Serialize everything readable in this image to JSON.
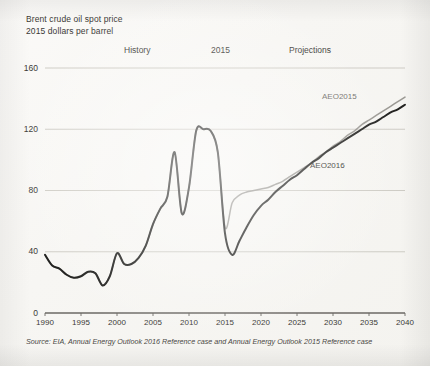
{
  "title": {
    "line1": "Brent crude oil spot price",
    "line2": "2015 dollars per barrel"
  },
  "annotations": {
    "history": "History",
    "divider_year": "2015",
    "projections": "Projections"
  },
  "series_labels": {
    "aeo2015": "AEO2015",
    "aeo2016": "AEO2016"
  },
  "source": "Source: EIA, Annual Energy Outlook 2016 Reference case and Annual Energy Outlook 2015 Reference case",
  "colors": {
    "aeo2016": "#1a1a18",
    "aeo2015": "#8e8c86",
    "grid": "#c9c7c0",
    "axis": "#6b6964",
    "text": "#3b3a36"
  },
  "chart_data": {
    "type": "line",
    "title": "Brent crude oil spot price",
    "subtitle": "2015 dollars per barrel",
    "xlabel": "",
    "ylabel": "2015 dollars per barrel",
    "xlim": [
      1990,
      2040
    ],
    "ylim": [
      0,
      160
    ],
    "yticks": [
      0,
      40,
      80,
      120,
      160
    ],
    "xticks": [
      1990,
      1995,
      2000,
      2005,
      2010,
      2015,
      2020,
      2025,
      2030,
      2035,
      2040
    ],
    "grid": true,
    "legend": "inline-labels",
    "history_end_year": 2015,
    "series": [
      {
        "name": "AEO2016",
        "color": "#1a1a18",
        "x": [
          1990,
          1991,
          1992,
          1993,
          1994,
          1995,
          1996,
          1997,
          1998,
          1999,
          2000,
          2001,
          2002,
          2003,
          2004,
          2005,
          2006,
          2007,
          2008,
          2009,
          2010,
          2011,
          2012,
          2013,
          2014,
          2015,
          2016,
          2017,
          2018,
          2019,
          2020,
          2021,
          2022,
          2023,
          2024,
          2025,
          2026,
          2027,
          2028,
          2029,
          2030,
          2031,
          2032,
          2033,
          2034,
          2035,
          2036,
          2037,
          2038,
          2039,
          2040
        ],
        "values": [
          38,
          31,
          29,
          25,
          23,
          24,
          27,
          26,
          18,
          24,
          39,
          32,
          32,
          36,
          44,
          58,
          68,
          76,
          105,
          65,
          82,
          119,
          120,
          119,
          105,
          52,
          38,
          47,
          56,
          64,
          70,
          74,
          79,
          83,
          87,
          90,
          94,
          98,
          101,
          105,
          108,
          111,
          114,
          117,
          120,
          123,
          125,
          128,
          131,
          133,
          136
        ]
      },
      {
        "name": "AEO2015",
        "color": "#8e8c86",
        "x": [
          1990,
          1991,
          1992,
          1993,
          1994,
          1995,
          1996,
          1997,
          1998,
          1999,
          2000,
          2001,
          2002,
          2003,
          2004,
          2005,
          2006,
          2007,
          2008,
          2009,
          2010,
          2011,
          2012,
          2013,
          2014,
          2015,
          2016,
          2017,
          2018,
          2019,
          2020,
          2021,
          2022,
          2023,
          2024,
          2025,
          2026,
          2027,
          2028,
          2029,
          2030,
          2031,
          2032,
          2033,
          2034,
          2035,
          2036,
          2037,
          2038,
          2039,
          2040
        ],
        "values": [
          38,
          31,
          29,
          25,
          23,
          24,
          27,
          26,
          18,
          24,
          39,
          32,
          32,
          36,
          44,
          58,
          68,
          76,
          105,
          65,
          82,
          119,
          120,
          119,
          105,
          56,
          72,
          77,
          79,
          80,
          81,
          82,
          84,
          86,
          89,
          92,
          95,
          98,
          102,
          105,
          109,
          112,
          116,
          119,
          123,
          126,
          129,
          132,
          135,
          138,
          141
        ]
      }
    ]
  }
}
